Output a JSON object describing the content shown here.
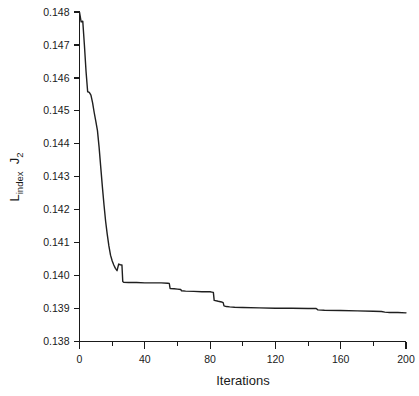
{
  "chart_data": {
    "type": "line",
    "title": "",
    "subtitle": "",
    "xlabel": "Iterations",
    "ylabel_parts": {
      "base1": "L",
      "sub1": "index",
      "gap": " ",
      "base2": "J",
      "sub2": "2"
    },
    "ylabel": "L index  J 2",
    "xlim": [
      0,
      200
    ],
    "ylim": [
      0.138,
      0.148
    ],
    "grid": false,
    "legend": null,
    "legend_position": "none",
    "x_major_ticks": [
      0,
      40,
      80,
      120,
      160,
      200
    ],
    "x_major_tick_labels": [
      "0",
      "40",
      "80",
      "120",
      "160",
      "200"
    ],
    "x_minor_ticks": [
      20,
      60,
      100,
      140,
      180
    ],
    "y_major_ticks": [
      0.138,
      0.139,
      0.14,
      0.141,
      0.142,
      0.143,
      0.144,
      0.145,
      0.146,
      0.147,
      0.148
    ],
    "y_major_tick_labels": [
      "0.138",
      "0.139",
      "0.140",
      "0.141",
      "0.142",
      "0.143",
      "0.144",
      "0.145",
      "0.146",
      "0.147",
      "0.148"
    ],
    "series": [
      {
        "name": "convergence",
        "color": "#1f1f1f",
        "x": [
          0,
          1,
          2,
          3,
          4,
          5,
          6,
          7,
          8,
          9,
          10,
          11,
          12,
          13,
          14,
          15,
          16,
          17,
          18,
          19,
          20,
          21,
          22,
          23,
          24,
          25,
          26,
          26.5,
          27,
          30,
          35,
          40,
          45,
          50,
          54,
          55,
          55.5,
          58,
          60,
          62,
          62.5,
          65,
          70,
          75,
          80,
          81,
          82,
          82.5,
          85,
          87,
          88,
          88.5,
          90,
          92,
          95,
          100,
          110,
          120,
          130,
          140,
          145,
          146,
          150,
          160,
          170,
          180,
          185,
          187,
          190,
          195,
          200
        ],
        "y": [
          0.148,
          0.1477,
          0.14772,
          0.147,
          0.1462,
          0.14558,
          0.14556,
          0.14548,
          0.14525,
          0.14495,
          0.14468,
          0.1444,
          0.1439,
          0.1433,
          0.1427,
          0.14215,
          0.14165,
          0.14125,
          0.1409,
          0.14062,
          0.14045,
          0.14032,
          0.14022,
          0.14015,
          0.14035,
          0.14033,
          0.14032,
          0.13982,
          0.1398,
          0.13979,
          0.13979,
          0.13978,
          0.13978,
          0.13978,
          0.13977,
          0.13976,
          0.13961,
          0.1396,
          0.13959,
          0.13958,
          0.13954,
          0.13953,
          0.13952,
          0.13951,
          0.13951,
          0.1395,
          0.13949,
          0.13925,
          0.13922,
          0.1392,
          0.13918,
          0.13908,
          0.13906,
          0.13905,
          0.13904,
          0.13903,
          0.13902,
          0.13901,
          0.13901,
          0.139,
          0.139,
          0.13896,
          0.13895,
          0.13894,
          0.13893,
          0.13892,
          0.13891,
          0.13889,
          0.13888,
          0.13888,
          0.13887
        ]
      }
    ]
  },
  "style": {
    "background": "#ffffff",
    "line_color": "#1f1f1f",
    "axis_color": "#1a1a1a"
  }
}
